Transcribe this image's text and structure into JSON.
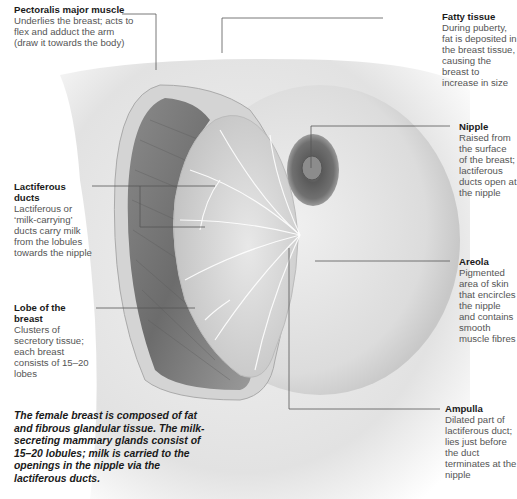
{
  "diagram": {
    "labels": [
      {
        "id": "pectoralis",
        "title": "Pectoralis major muscle",
        "desc": "Underlies the breast; acts to flex and adduct the arm (draw it towards the body)"
      },
      {
        "id": "fatty",
        "title": "Fatty tissue",
        "desc": "During puberty, fat is deposited in the breast tissue, causing the breast to increase in size"
      },
      {
        "id": "nipple",
        "title": "Nipple",
        "desc": "Raised from the surface of the breast; lactiferous ducts open at the nipple"
      },
      {
        "id": "lactiferous",
        "title": "Lactiferous ducts",
        "desc": "Lactiferous or ‘milk-carrying’ ducts carry milk from the lobules towards the nipple"
      },
      {
        "id": "areola",
        "title": "Areola",
        "desc": "Pigmented area of skin that encircles the nipple and contains smooth muscle fibres"
      },
      {
        "id": "lobe",
        "title": "Lobe of the breast",
        "desc": "Clusters of secretory tissue; each breast consists of 15–20 lobes"
      },
      {
        "id": "ampulla",
        "title": "Ampulla",
        "desc": "Dilated part of lactiferous duct; lies just before the duct terminates at the nipple"
      }
    ],
    "caption": "The female breast is composed of fat and fibrous glandular tissue. The milk-secreting mammary glands consist of 15–20 lobules; milk is carried to the openings in the nipple via the lactiferous ducts.",
    "colors": {
      "leader_line": "#555555",
      "skin": "#e6e6e6",
      "muscle": "#7a7a7a",
      "lobules": "#d8d8d8",
      "areola": "#6e6e6e"
    }
  }
}
